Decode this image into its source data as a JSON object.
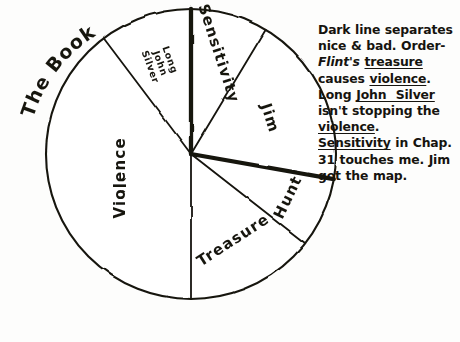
{
  "title": "The Book",
  "background_color": "#fdfdfc",
  "ink_color": "#16140f",
  "note": {
    "name": "annotation-note",
    "segments": [
      {
        "text": "Dark line separates nice & bad. Order-",
        "style": "plain"
      },
      {
        "text": "Flint's",
        "style": "italic"
      },
      {
        "text": " ",
        "style": "plain"
      },
      {
        "text": "treasure",
        "style": "underline"
      },
      {
        "text": " causes ",
        "style": "plain"
      },
      {
        "text": "violence",
        "style": "underline"
      },
      {
        "text": ". Long ",
        "style": "plain"
      },
      {
        "text": "John  Silver",
        "style": "underline"
      },
      {
        "text": " isn't stopping the ",
        "style": "plain"
      },
      {
        "text": "violence",
        "style": "underline"
      },
      {
        "text": ". ",
        "style": "plain"
      },
      {
        "text": "Sensitivity",
        "style": "underline"
      },
      {
        "text": " in Chap. 31 touches me. Jim got the map.",
        "style": "plain"
      }
    ],
    "plain_text": "Dark line separates nice & bad. Order-Flint's treasure causes violence. Long John Silver isn't stopping the violence. Sensitivity in Chap. 31 touches me. Jim got the map."
  },
  "chart_data": {
    "type": "pie",
    "title": "The Book",
    "xlabel": "",
    "ylabel": "",
    "center": {
      "x": 191,
      "y": 154
    },
    "radius": 145,
    "units": "degrees",
    "total_degrees": 360,
    "note": "Hand-drawn pie chart. Angles measured clockwise from 12 o'clock. A heavy dark line (the Jim / Hunt boundary and the 12 o'clock radius) separates 'nice' from 'bad' themes.",
    "categories": [
      "Sensitivity",
      "Jim",
      "Hunt",
      "Treasure",
      "Violence",
      "Long John Silver"
    ],
    "values": [
      31,
      69,
      28,
      52,
      143,
      37
    ],
    "percentages": [
      8.6,
      19.2,
      7.8,
      14.4,
      39.7,
      10.3
    ],
    "slices": [
      {
        "label": "Sensitivity",
        "start_deg": 0,
        "end_deg": 31,
        "degrees": 31,
        "percent": 8.6,
        "label_rotation": 72,
        "label_size": "large",
        "label_radius": 0.72,
        "group": "nice"
      },
      {
        "label": "Jim",
        "start_deg": 31,
        "end_deg": 100,
        "degrees": 69,
        "percent": 19.2,
        "label_rotation": 72,
        "label_size": "large",
        "label_radius": 0.6,
        "group": "nice"
      },
      {
        "label": "Hunt",
        "start_deg": 100,
        "end_deg": 128,
        "degrees": 28,
        "percent": 7.8,
        "label_rotation": -64,
        "label_size": "large",
        "label_radius": 0.73,
        "group": "bad"
      },
      {
        "label": "Treasure",
        "start_deg": 128,
        "end_deg": 180,
        "degrees": 52,
        "percent": 14.4,
        "label_rotation": -33,
        "label_size": "large",
        "label_radius": 0.66,
        "group": "bad"
      },
      {
        "label": "Violence",
        "start_deg": 180,
        "end_deg": 323,
        "degrees": 143,
        "percent": 39.7,
        "label_rotation": -90,
        "label_size": "large",
        "label_radius": 0.52,
        "group": "bad"
      },
      {
        "label": "Long John Silver",
        "start_deg": 323,
        "end_deg": 360,
        "degrees": 37,
        "percent": 10.3,
        "label_rotation": 70,
        "label_size": "small",
        "label_radius": 0.66,
        "group": "nice",
        "label_lines": [
          "Long",
          "John",
          "Silver"
        ]
      }
    ],
    "heavy_lines": [
      {
        "name": "top-radius",
        "angle_deg": 0,
        "description": "thick vertical line from centre to top of circle"
      },
      {
        "name": "jim-hunt-divider",
        "angle_deg": 100,
        "description": "thick dark line separating nice from bad"
      }
    ],
    "grid": false,
    "legend": false,
    "legend_position": "none"
  }
}
